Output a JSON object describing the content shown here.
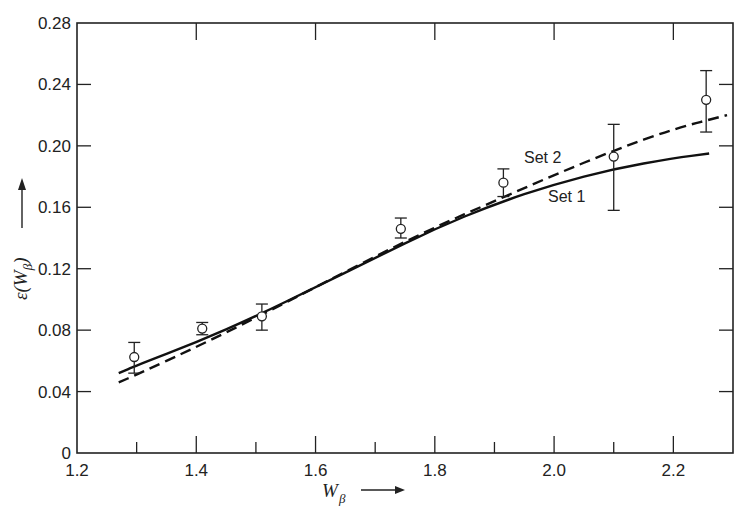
{
  "chart_data": {
    "type": "line",
    "title": "",
    "xlabel": "W_β →",
    "ylabel": "ε(W_β) →",
    "xlim": [
      1.2,
      2.3
    ],
    "ylim": [
      0,
      0.28
    ],
    "xticks_major": [
      1.2,
      1.4,
      1.6,
      1.8,
      2.0,
      2.2
    ],
    "xtick_labels": [
      "1.2",
      "1.4",
      "1.6",
      "1.8",
      "2.0",
      "2.2"
    ],
    "xticks_minor": [
      1.3,
      1.5,
      1.7,
      1.9,
      2.1
    ],
    "yticks": [
      0,
      0.04,
      0.08,
      0.12,
      0.16,
      0.2,
      0.24,
      0.28
    ],
    "ytick_labels": [
      "0",
      "0.04",
      "0.08",
      "0.12",
      "0.16",
      "0.20",
      "0.24",
      "0.28"
    ],
    "grid": false,
    "legend_position": "inline annotations near curves",
    "series": [
      {
        "name": "Set 1",
        "style": "solid",
        "x": [
          1.27,
          1.3,
          1.4,
          1.5,
          1.6,
          1.7,
          1.8,
          1.9,
          2.0,
          2.1,
          2.2,
          2.26
        ],
        "y": [
          0.052,
          0.057,
          0.072,
          0.089,
          0.108,
          0.127,
          0.146,
          0.162,
          0.175,
          0.185,
          0.192,
          0.195
        ]
      },
      {
        "name": "Set 2",
        "style": "dashed",
        "x": [
          1.27,
          1.3,
          1.4,
          1.5,
          1.6,
          1.7,
          1.8,
          1.9,
          2.0,
          2.1,
          2.2,
          2.29
        ],
        "y": [
          0.046,
          0.051,
          0.069,
          0.088,
          0.108,
          0.128,
          0.147,
          0.164,
          0.181,
          0.197,
          0.211,
          0.22
        ]
      },
      {
        "name": "Measured",
        "style": "open-circle markers with error bars",
        "x": [
          1.296,
          1.41,
          1.51,
          1.743,
          1.915,
          2.1,
          2.255
        ],
        "y": [
          0.0625,
          0.081,
          0.089,
          0.146,
          0.176,
          0.193,
          0.23
        ],
        "yerr_low": [
          0.052,
          0.077,
          0.08,
          0.14,
          0.167,
          0.158,
          0.209
        ],
        "yerr_high": [
          0.072,
          0.085,
          0.097,
          0.153,
          0.185,
          0.214,
          0.249
        ]
      }
    ],
    "annotations": [
      "Set 2",
      "Set 1"
    ]
  },
  "labels": {
    "x_axis_symbol": "W",
    "x_axis_subscript": "β",
    "y_axis_epsilon": "ε(",
    "y_axis_symbol": "W",
    "y_axis_subscript": "β",
    "y_axis_close": ")",
    "set1": "Set 1",
    "set2": "Set 2"
  }
}
